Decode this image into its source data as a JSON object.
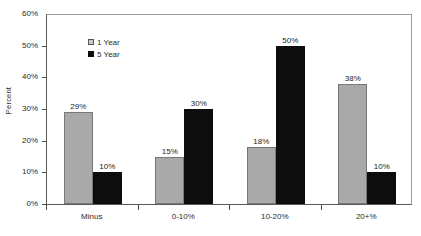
{
  "chart_data": {
    "type": "bar",
    "title": "",
    "subtitle": "",
    "xlabel": "",
    "ylabel": "Percent",
    "categories": [
      "Minus",
      "0-10%",
      "10-20%",
      "20+%"
    ],
    "series": [
      {
        "name": "1 Year",
        "color": "#a9a9a9",
        "values": [
          29,
          15,
          18,
          38
        ],
        "labels": [
          "29%",
          "15%",
          "18%",
          "38%"
        ]
      },
      {
        "name": "5 Year",
        "color": "#0d0d0d",
        "values": [
          10,
          30,
          50,
          10
        ],
        "labels": [
          "10%",
          "30%",
          "50%",
          "10%"
        ]
      }
    ],
    "ylim": [
      0,
      60
    ],
    "yticks": [
      0,
      10,
      20,
      30,
      40,
      50,
      60
    ],
    "ytick_labels": [
      "0%",
      "10%",
      "20%",
      "30%",
      "40%",
      "50%",
      "60%"
    ],
    "grid": false,
    "legend_position": "upper-left-inside",
    "value_labels_shown": true
  },
  "legend": {
    "items": [
      {
        "label": "1 Year",
        "swatch": "legend-swatch-gray"
      },
      {
        "label": "5 Year",
        "swatch": "legend-swatch-black"
      }
    ]
  }
}
